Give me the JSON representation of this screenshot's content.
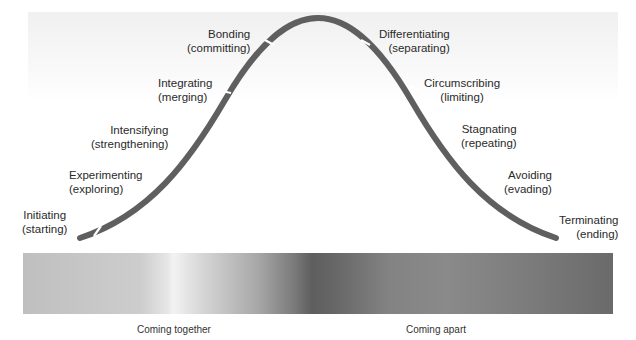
{
  "diagram": {
    "stages_coming_together": [
      {
        "name": "Initiating",
        "desc": "(starting)"
      },
      {
        "name": "Experimenting",
        "desc": "(exploring)"
      },
      {
        "name": "Intensifying",
        "desc": "(strengthening)"
      },
      {
        "name": "Integrating",
        "desc": "(merging)"
      },
      {
        "name": "Bonding",
        "desc": "(committing)"
      }
    ],
    "stages_coming_apart": [
      {
        "name": "Differentiating",
        "desc": "(separating)"
      },
      {
        "name": "Circumscribing",
        "desc": "(limiting)"
      },
      {
        "name": "Stagnating",
        "desc": "(repeating)"
      },
      {
        "name": "Avoiding",
        "desc": "(evading)"
      },
      {
        "name": "Terminating",
        "desc": "(ending)"
      }
    ],
    "phases": {
      "together": "Coming together",
      "apart": "Coming apart"
    },
    "colors": {
      "curve": "#5f5f5f",
      "text": "#2a2a2a"
    }
  }
}
